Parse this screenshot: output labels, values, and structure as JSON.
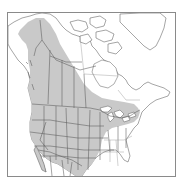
{
  "map": {
    "title": "Range map of North America",
    "region": "North America",
    "legend": {
      "range_label": "Range (shaded)"
    },
    "colors": {
      "background": "#ffffff",
      "range_fill": "#c9c9c9",
      "boundary_lines": "#5a5a5a",
      "frame": "#8a8a8a"
    },
    "shaded_regions": [
      "Alaska (interior and north)",
      "Yukon",
      "Western Northwest Territories",
      "British Columbia",
      "Alberta",
      "Saskatchewan",
      "Manitoba",
      "Northern Ontario",
      "Southern Quebec",
      "Western and central United States",
      "Great Lakes region",
      "New England",
      "Northern Mexico"
    ],
    "unshaded_regions": [
      "Arctic Archipelago",
      "Greenland",
      "Nunavut / Hudson Bay region",
      "Labrador",
      "Southeastern United States"
    ]
  }
}
